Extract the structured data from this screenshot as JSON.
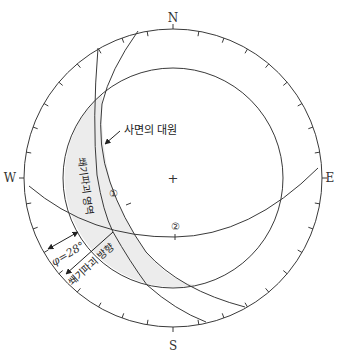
{
  "diagram": {
    "type": "stereonet",
    "directions": {
      "north": "N",
      "south": "S",
      "east": "E",
      "west": "W"
    },
    "center_marker": "+",
    "labels": {
      "slope_great_circle": "사면의 대원",
      "failure_zone": "쐐기파괴 영역",
      "failure_direction": "쐐기파괴 방향",
      "friction_angle": "φ=28°",
      "plane_1": "①",
      "plane_2": "②"
    },
    "colors": {
      "line": "#3a3a3a",
      "shade": "#ececec",
      "background": "#ffffff"
    }
  }
}
